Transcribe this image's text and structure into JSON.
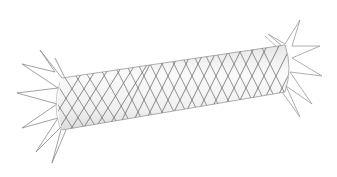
{
  "image": {
    "subject": "braided stent",
    "background_color": "#ffffff",
    "wire_color_dark": "#555555",
    "wire_color_light": "#9a9a9a",
    "tube_fill": "#f2f2f2"
  }
}
